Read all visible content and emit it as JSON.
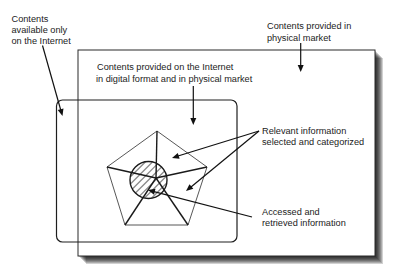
{
  "diagram": {
    "labels": {
      "internet_only": [
        "Contents",
        "available only",
        "on the Internet"
      ],
      "physical_market": [
        "Contents provided in",
        "physical market"
      ],
      "digital_and_physical": [
        "Contents provided on the Internet",
        "in digital format and in physical market"
      ],
      "relevant_info": [
        "Relevant information",
        "selected and categorized"
      ],
      "accessed_info": [
        "Accessed and",
        "retrieved information"
      ]
    },
    "regions": {
      "outer_box": "physical market contents",
      "rounded_box": "internet contents",
      "pentagon": "relevant information selected and categorized",
      "hatched_circle": "accessed and retrieved information"
    },
    "colors": {
      "stroke": "#1a1a1a",
      "text": "#222222",
      "hatch": "#8a8a8a",
      "background": "#ffffff"
    }
  }
}
